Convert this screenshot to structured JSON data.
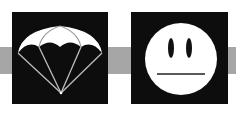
{
  "colors": {
    "background": "#ffffff",
    "band": "#a6a6a6",
    "tile": "#0d0d0d",
    "symbol": "#ffffff",
    "line": "#bdbdbd"
  },
  "icons": [
    {
      "name": "parachute-icon",
      "label": ""
    },
    {
      "name": "neutral-face-icon",
      "label": ""
    }
  ]
}
